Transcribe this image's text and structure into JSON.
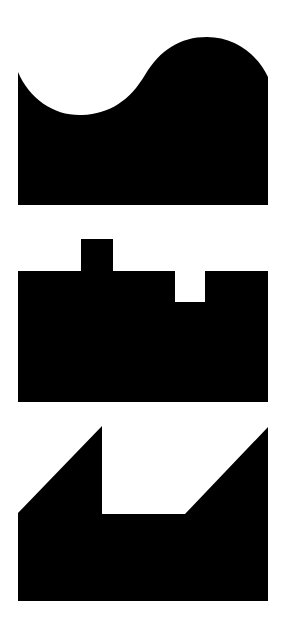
{
  "canvas": {
    "width": 286,
    "height": 624,
    "background": "#ffffff"
  },
  "colors": {
    "shape_fill": "#000000"
  },
  "shapes": [
    {
      "id": "wave-block",
      "description": "Rectangle with wavy S-curve top edge",
      "path": "M18,72 C30,100 55,116 82,115 C110,114 130,100 145,75 C160,50 180,37 207,37 C235,37 258,55 268,77 L268,205 L18,205 Z"
    },
    {
      "id": "notched-block",
      "description": "Rectangle with a raised square tab on top and a square notch cut into the top",
      "path": "M18,271 L81,271 L81,239 L113,239 L113,271 L175,271 L175,302 L205,302 L205,271 L268,271 L268,402 L18,402 Z"
    },
    {
      "id": "angled-block",
      "description": "Rectangle with two diagonal peaks and a flat recessed middle",
      "path": "M18,513 L102,426 L102,514 L185,514 L268,427 L268,601 L18,601 Z"
    }
  ]
}
